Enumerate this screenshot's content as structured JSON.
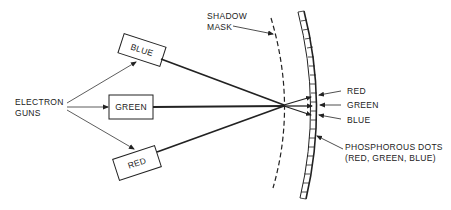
{
  "diagram": {
    "type": "shadow-mask CRT color display",
    "labels": {
      "electron_guns_line1": "ELECTRON",
      "electron_guns_line2": "GUNS",
      "gun_blue": "BLUE",
      "gun_green": "GREEN",
      "gun_red": "RED",
      "shadow_mask_line1": "SHADOW",
      "shadow_mask_line2": "MASK",
      "dot_red": "RED",
      "dot_green": "GREEN",
      "dot_blue": "BLUE",
      "phosphor_line1": "PHOSPHOROUS DOTS",
      "phosphor_line2": "(RED, GREEN, BLUE)"
    },
    "colors": {
      "ink": "#222222",
      "background": "#ffffff"
    }
  }
}
